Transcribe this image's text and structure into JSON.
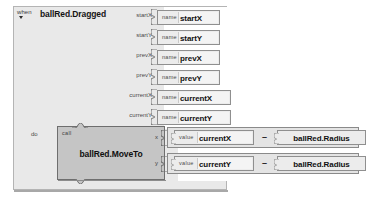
{
  "blocks_editor": {
    "event_block": {
      "keyword": "when",
      "dropdown_icon": "triangle-down-icon",
      "title": "ballRed.Dragged",
      "do_label": "do",
      "parameters": [
        {
          "name": "startX",
          "getter_keyword": "name",
          "getter_value": "startX"
        },
        {
          "name": "startY",
          "getter_keyword": "name",
          "getter_value": "startY"
        },
        {
          "name": "prevX",
          "getter_keyword": "name",
          "getter_value": "prevX"
        },
        {
          "name": "prevY",
          "getter_keyword": "name",
          "getter_value": "prevY"
        },
        {
          "name": "currentX",
          "getter_keyword": "name",
          "getter_value": "currentX"
        },
        {
          "name": "currentY",
          "getter_keyword": "name",
          "getter_value": "currentY"
        }
      ]
    },
    "call_block": {
      "keyword": "call",
      "title": "ballRed.MoveTo",
      "arguments": [
        {
          "label": "x",
          "left_keyword": "value",
          "left_value": "currentX",
          "operator": "–",
          "right_value": "ballRed.Radius"
        },
        {
          "label": "y",
          "left_keyword": "value",
          "left_value": "currentY",
          "operator": "–",
          "right_value": "ballRed.Radius"
        }
      ]
    },
    "colors": {
      "canvas": "#ffffff",
      "event_block_fill": "#e9e9e9",
      "event_block_stroke": "#b4b4b4",
      "call_block_fill": "#c5c5c5",
      "call_block_stroke": "#6e6e6e",
      "getter_fill": "#ececec",
      "getter_stroke": "#8f8f8f",
      "expression_fill": "#e4e4e4",
      "text_primary": "#111111",
      "text_secondary": "#4a4a4a"
    }
  }
}
